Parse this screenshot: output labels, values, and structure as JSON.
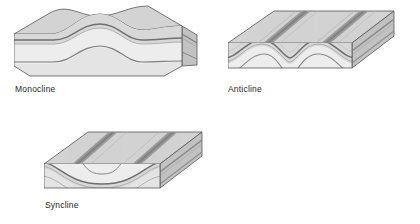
{
  "page": {
    "background_color": "#ffffff",
    "width": 420,
    "height": 224
  },
  "palette": {
    "top_surface": "#d3d3d3",
    "top_surface_dark": "#c6c6c6",
    "front_band_upper": "#d8d8d8",
    "front_band_light": "#ededed",
    "front_band_lower": "#e4e4e4",
    "side_face": "#c2c2c2",
    "marker_layer": "#8a8a8a",
    "marker_layer_dark": "#6f6f6f",
    "ridge_dark": "#9a9a9a",
    "ridge_darker": "#848484",
    "outline": "#555555",
    "text": "#231f20"
  },
  "figures": [
    {
      "id": "monocline",
      "label": "Monocline",
      "description": "Block diagram of a monocline: a step-like flexure where horizontal strata bend down to a lower level and become horizontal again.",
      "fold_type": "monocline",
      "limb_dip_direction": "down to the right",
      "top_surface_ridges": 0,
      "strata_bands": 3,
      "marker_layers": 2
    },
    {
      "id": "anticline",
      "label": "Anticline",
      "description": "Block diagram of an eroded anticline: strata arch upward, the crest is truncated by erosion leaving two parallel ridges of resistant rock dipping away from the axis.",
      "fold_type": "anticline",
      "limb_dip_direction": "away from fold axis",
      "top_surface_ridges": 2,
      "strata_bands": 3,
      "marker_layers": 2
    },
    {
      "id": "syncline",
      "label": "Syncline",
      "description": "Block diagram of an eroded syncline: strata sag downward in a U-shaped trough, erosion leaves two parallel ridges of resistant rock dipping toward the axis.",
      "fold_type": "syncline",
      "limb_dip_direction": "toward fold axis",
      "top_surface_ridges": 2,
      "strata_bands": 3,
      "marker_layers": 2
    }
  ]
}
